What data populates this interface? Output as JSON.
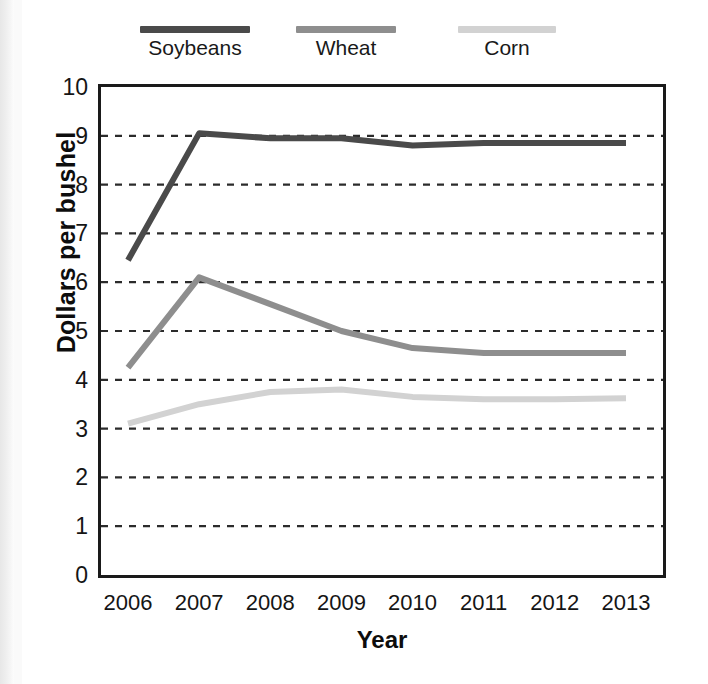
{
  "chart_data": {
    "type": "line",
    "title": "",
    "xlabel": "Year",
    "ylabel": "Dollars per bushel",
    "categories": [
      "2006",
      "2007",
      "2008",
      "2009",
      "2010",
      "2011",
      "2012",
      "2013"
    ],
    "x": [
      2006,
      2007,
      2008,
      2009,
      2010,
      2011,
      2012,
      2013
    ],
    "xlim": [
      2006,
      2013
    ],
    "ylim": [
      0,
      10
    ],
    "yticks": [
      0,
      1,
      2,
      3,
      4,
      5,
      6,
      7,
      8,
      9,
      10
    ],
    "grid": "horizontal-dashed",
    "legend_position": "top",
    "series": [
      {
        "name": "Soybeans",
        "color": "#4a4a4a",
        "values": [
          6.45,
          9.05,
          8.95,
          8.95,
          8.8,
          8.85,
          8.85,
          8.85
        ]
      },
      {
        "name": "Wheat",
        "color": "#8e8e8e",
        "values": [
          4.25,
          6.1,
          5.55,
          5.0,
          4.65,
          4.55,
          4.55,
          4.55
        ]
      },
      {
        "name": "Corn",
        "color": "#d2d2d2",
        "values": [
          3.1,
          3.5,
          3.75,
          3.8,
          3.65,
          3.6,
          3.6,
          3.62
        ]
      }
    ]
  },
  "legend": {
    "items": [
      {
        "label": "Soybeans",
        "color": "#4a4a4a"
      },
      {
        "label": "Wheat",
        "color": "#8e8e8e"
      },
      {
        "label": "Corn",
        "color": "#d2d2d2"
      }
    ]
  },
  "axes": {
    "y_title": "Dollars per bushel",
    "x_title": "Year",
    "y_tick_labels": [
      "10",
      "9",
      "8",
      "7",
      "6",
      "5",
      "4",
      "3",
      "2",
      "1",
      "0"
    ],
    "x_tick_labels": [
      "2006",
      "2007",
      "2008",
      "2009",
      "2010",
      "2011",
      "2012",
      "2013"
    ]
  },
  "colors": {
    "axis": "#1a1a1a",
    "grid": "#2b2b2b",
    "background": "#ffffff"
  }
}
